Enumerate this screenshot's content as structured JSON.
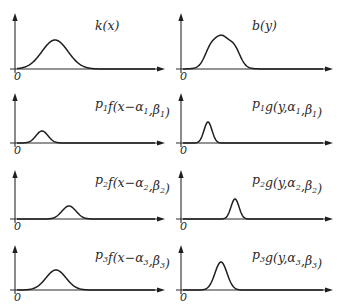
{
  "figure": {
    "origin_label": "0",
    "panels": [
      {
        "id": "k",
        "column": "left",
        "row": 0,
        "label": "k(x)",
        "label_parts": [
          {
            "t": "k(x)"
          }
        ]
      },
      {
        "id": "b",
        "column": "right",
        "row": 0,
        "label": "b(y)",
        "label_parts": [
          {
            "t": "b(y)"
          }
        ]
      },
      {
        "id": "f1",
        "column": "left",
        "row": 1,
        "label": "p1 f(x−α1, β1)",
        "label_parts": [
          {
            "t": "p"
          },
          {
            "s": "1"
          },
          {
            "t": "f(x−α"
          },
          {
            "s": "1"
          },
          {
            "t": ",β"
          },
          {
            "s": "1"
          },
          {
            "t": ")"
          }
        ]
      },
      {
        "id": "g1",
        "column": "right",
        "row": 1,
        "label": "p1 g(y, α1, β1)",
        "label_parts": [
          {
            "t": "p"
          },
          {
            "s": "1"
          },
          {
            "t": "g(y,α"
          },
          {
            "s": "1"
          },
          {
            "t": ",β"
          },
          {
            "s": "1"
          },
          {
            "t": ")"
          }
        ]
      },
      {
        "id": "f2",
        "column": "left",
        "row": 2,
        "label": "p2 f(x−α2, β2)",
        "label_parts": [
          {
            "t": "p"
          },
          {
            "s": "2"
          },
          {
            "t": "f(x−α"
          },
          {
            "s": "2"
          },
          {
            "t": ",β"
          },
          {
            "s": "2"
          },
          {
            "t": ")"
          }
        ]
      },
      {
        "id": "g2",
        "column": "right",
        "row": 2,
        "label": "p2 g(y, α2, β2)",
        "label_parts": [
          {
            "t": "p"
          },
          {
            "s": "2"
          },
          {
            "t": "g(y,α"
          },
          {
            "s": "2"
          },
          {
            "t": ",β"
          },
          {
            "s": "2"
          },
          {
            "t": ")"
          }
        ]
      },
      {
        "id": "f3",
        "column": "left",
        "row": 3,
        "label": "p3 f(x−α3, β3)",
        "label_parts": [
          {
            "t": "p"
          },
          {
            "s": "3"
          },
          {
            "t": "f(x−α"
          },
          {
            "s": "3"
          },
          {
            "t": ",β"
          },
          {
            "s": "3"
          },
          {
            "t": ")"
          }
        ]
      },
      {
        "id": "g3",
        "column": "right",
        "row": 3,
        "label": "p3 g(y, α3, β3)",
        "label_parts": [
          {
            "t": "p"
          },
          {
            "s": "3"
          },
          {
            "t": "g(y,α"
          },
          {
            "s": "3"
          },
          {
            "t": ",β"
          },
          {
            "s": "3"
          },
          {
            "t": ")"
          }
        ]
      }
    ]
  },
  "layout": {
    "columns": {
      "left": {
        "axis_x": 15,
        "arrow_end": 165,
        "label_x": 95
      },
      "right": {
        "axis_x": 181,
        "arrow_end": 333,
        "label_x": 252
      }
    },
    "rows": [
      {
        "top": 13,
        "base": 69,
        "label_y": 30
      },
      {
        "top": 93,
        "base": 143,
        "label_y": 108
      },
      {
        "top": 170,
        "base": 219,
        "label_y": 184
      },
      {
        "top": 245,
        "base": 290,
        "label_y": 259
      }
    ]
  },
  "curves": {
    "k": {
      "components": [
        {
          "center": 55,
          "width": 13,
          "height": 29
        }
      ]
    },
    "b": {
      "components": [
        {
          "center": 211,
          "width": 6,
          "height": 18
        },
        {
          "center": 222,
          "width": 6,
          "height": 22
        },
        {
          "center": 234,
          "width": 6,
          "height": 18
        }
      ],
      "envelope": {
        "center": 222.5,
        "width": 13,
        "height": 6
      }
    },
    "f1": {
      "components": [
        {
          "center": 42,
          "width": 6,
          "height": 12
        }
      ]
    },
    "g1": {
      "components": [
        {
          "center": 208,
          "width": 4,
          "height": 21
        }
      ]
    },
    "f2": {
      "components": [
        {
          "center": 69,
          "width": 7,
          "height": 13
        }
      ]
    },
    "g2": {
      "components": [
        {
          "center": 235,
          "width": 4,
          "height": 20
        }
      ]
    },
    "f3": {
      "components": [
        {
          "center": 56,
          "width": 10,
          "height": 20
        }
      ]
    },
    "g3": {
      "components": [
        {
          "center": 221,
          "width": 6,
          "height": 28
        }
      ]
    }
  }
}
